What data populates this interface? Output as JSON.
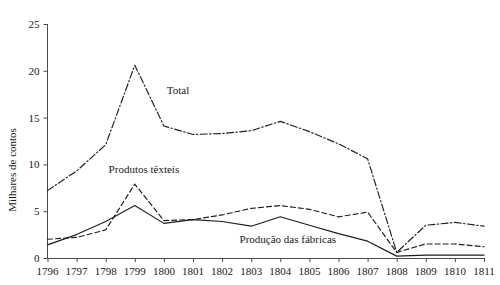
{
  "caption": {
    "top_strip_text": ""
  },
  "chart_data": {
    "type": "line",
    "title": "",
    "xlabel": "",
    "ylabel": "Milhares de contos",
    "x": [
      1796,
      1797,
      1798,
      1799,
      1800,
      1801,
      1802,
      1803,
      1804,
      1805,
      1806,
      1807,
      1808,
      1809,
      1810,
      1811
    ],
    "xtick_labels": [
      "1796",
      "1797",
      "1798",
      "1799",
      "1800",
      "1801",
      "1802",
      "1803",
      "1804",
      "1805",
      "1806",
      "1807",
      "1808",
      "1809",
      "1810",
      "1811"
    ],
    "ytick_labels": [
      "0",
      "5",
      "10",
      "15",
      "20",
      "25"
    ],
    "yticks": [
      0,
      5,
      10,
      15,
      20,
      25
    ],
    "ylim": [
      0,
      25
    ],
    "xlim": [
      1796,
      1811
    ],
    "grid": false,
    "legend_position": "inline-annotations",
    "series": [
      {
        "name": "Total",
        "label": "Total",
        "style": "dash-dot",
        "label_x": 1800.1,
        "label_y": 17.5,
        "values": [
          7.2,
          9.3,
          12.1,
          20.6,
          14.1,
          13.2,
          13.3,
          13.6,
          14.6,
          13.5,
          12.2,
          10.6,
          0.6,
          3.5,
          3.8,
          3.4
        ]
      },
      {
        "name": "Produtos têxteis",
        "label": "Produtos têxteis",
        "style": "dashed",
        "label_x": 1798.1,
        "label_y": 9.1,
        "values": [
          2.0,
          2.2,
          3.0,
          7.9,
          4.0,
          4.1,
          4.6,
          5.3,
          5.6,
          5.2,
          4.4,
          4.9,
          0.6,
          1.5,
          1.5,
          1.2
        ]
      },
      {
        "name": "Produção das fábricas",
        "label": "Produção das fábricas",
        "style": "solid",
        "label_x": 1802.6,
        "label_y": 1.6,
        "values": [
          1.4,
          2.5,
          3.9,
          5.6,
          3.7,
          4.1,
          3.9,
          3.4,
          4.4,
          3.5,
          2.6,
          1.8,
          0.2,
          0.3,
          0.3,
          0.3
        ]
      }
    ]
  }
}
